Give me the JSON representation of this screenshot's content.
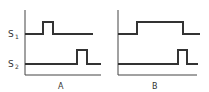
{
  "diagram": {
    "type": "timing-diagram",
    "signals": [
      {
        "name": "S",
        "subscript": "1"
      },
      {
        "name": "S",
        "subscript": "2"
      }
    ],
    "panels": [
      {
        "label": "A",
        "s1": "short pulse early",
        "s2": "short pulse late"
      },
      {
        "label": "B",
        "s1": "long pulse spanning most of interval",
        "s2": "short pulse late"
      }
    ]
  }
}
